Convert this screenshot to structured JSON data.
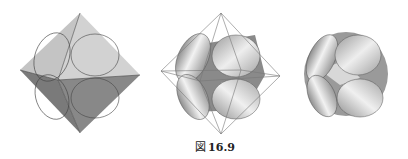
{
  "figure": {
    "caption_prefix": "図",
    "caption_number": "16.9"
  },
  "panels": [
    {
      "name": "octahedron-with-inscribed-circles",
      "description": "Solid octahedron with circles inscribed on faces"
    },
    {
      "name": "wireframe-octahedron-with-cones",
      "description": "Wireframe octahedron containing shaded cone-cut solid"
    },
    {
      "name": "rounded-solid",
      "description": "Resulting rounded solid with conical surfaces"
    }
  ],
  "colors": {
    "upper_face": "#c9c9c9",
    "upper_face_right": "#d6d6d6",
    "lower_face": "#7e7e7e",
    "lower_face_right": "#8a8a8a",
    "edge": "#444444",
    "wire": "#777777"
  }
}
